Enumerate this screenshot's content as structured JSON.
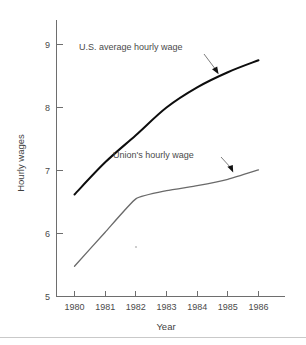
{
  "chart_data": {
    "type": "line",
    "title": "",
    "xlabel": "Year",
    "ylabel": "Hourly wages",
    "x": [
      1980,
      1981,
      1982,
      1983,
      1984,
      1985,
      1986
    ],
    "xtick_labels": [
      "1980",
      "1981",
      "1982",
      "1983",
      "1984",
      "1985",
      "1986"
    ],
    "ytick_labels": [
      "5",
      "6",
      "7",
      "8",
      "9"
    ],
    "yticks": [
      5,
      6,
      7,
      8,
      9
    ],
    "xlim": [
      1980,
      1986
    ],
    "ylim": [
      5,
      9.35
    ],
    "grid": false,
    "legend_position": "inline-annotations",
    "series": [
      {
        "name": "U.S. average hourly wage",
        "color": "#0d0d0d",
        "values": [
          6.62,
          7.13,
          7.56,
          8.0,
          8.32,
          8.56,
          8.75
        ]
      },
      {
        "name": "Union's hourly wage",
        "color": "#6a6a6a",
        "values": [
          5.48,
          6.02,
          6.55,
          6.68,
          6.76,
          6.86,
          7.01
        ]
      }
    ],
    "annotations": [
      {
        "text": "U.S. average hourly wage",
        "points_to_series": "U.S. average hourly wage",
        "points_to_x": 1984.6
      },
      {
        "text": "Union's hourly wage",
        "points_to_series": "Union's hourly wage",
        "points_to_x": 1985.4
      }
    ]
  },
  "axes": {
    "y_title": "Hourly wages",
    "x_title": "Year"
  }
}
